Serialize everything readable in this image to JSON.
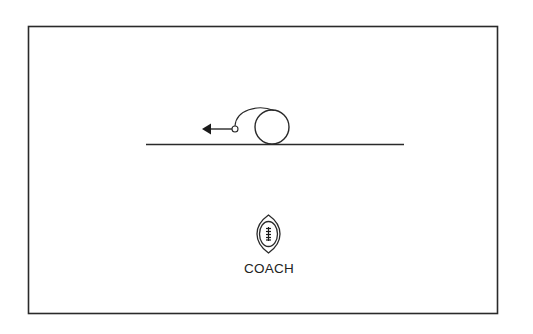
{
  "diagram": {
    "type": "football-play-diagram",
    "colors": {
      "stroke": "#2a2a2a",
      "background": "#ffffff"
    },
    "frame": {
      "x": 28,
      "y": 26,
      "width": 469,
      "height": 287
    },
    "line_of_scrimmage": {
      "x1": 146,
      "y1": 144,
      "x2": 404,
      "y2": 144
    },
    "player": {
      "shape": "circle",
      "cx": 272,
      "cy": 127,
      "r": 17
    },
    "route": {
      "start_marker": {
        "cx": 235,
        "cy": 129,
        "r": 3
      },
      "arrow_direction": "left",
      "arrow_tip_x": 202
    },
    "coach": {
      "icon": "football-icon",
      "label": "COACH"
    }
  }
}
